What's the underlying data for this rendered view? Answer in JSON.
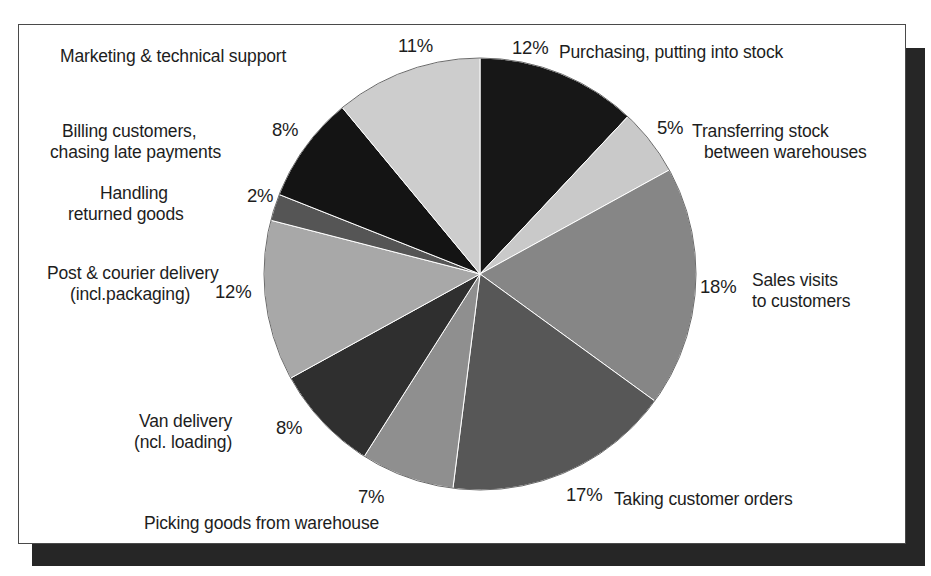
{
  "figure": {
    "background_color": "#ffffff",
    "frame_border_color": "#4a4a4a",
    "shadow_color": "#262626"
  },
  "chart_data": {
    "type": "pie",
    "title": "",
    "subtitle": "",
    "xlabel": "",
    "ylabel": "",
    "grid": false,
    "legend_position": "callout-labels-around-pie",
    "total": 100,
    "units": "percent",
    "start_angle_deg": 0,
    "direction": "clockwise",
    "categories": [
      "Purchasing, putting into stock",
      "Transferring stock between warehouses",
      "Sales visits to customers",
      "Taking customer orders",
      "Picking goods from warehouse",
      "Van delivery (incl. loading)",
      "Post & courier delivery (incl. packaging)",
      "Handling returned goods",
      "Billing customers, chasing late payments",
      "Marketing & technical support"
    ],
    "values": [
      12,
      5,
      18,
      17,
      7,
      8,
      12,
      2,
      8,
      11
    ],
    "slice_colors": [
      "#171717",
      "#c9c9c9",
      "#868686",
      "#575757",
      "#8f8f8f",
      "#2f2f2f",
      "#a8a8a8",
      "#555555",
      "#141414",
      "#cdcdcd"
    ],
    "slices": [
      {
        "label": "Purchasing, putting into stock",
        "value": 12,
        "pct_text": "12%",
        "color": "#171717"
      },
      {
        "label": "Transferring stock between warehouses",
        "value": 5,
        "pct_text": "5%",
        "color": "#c9c9c9"
      },
      {
        "label": "Sales visits to customers",
        "value": 18,
        "pct_text": "18%",
        "color": "#868686"
      },
      {
        "label": "Taking customer orders",
        "value": 17,
        "pct_text": "17%",
        "color": "#575757"
      },
      {
        "label": "Picking goods from warehouse",
        "value": 7,
        "pct_text": "7%",
        "color": "#8f8f8f"
      },
      {
        "label": "Van delivery (incl. loading)",
        "value": 8,
        "pct_text": "8%",
        "color": "#2f2f2f"
      },
      {
        "label": "Post & courier delivery (incl. packaging)",
        "value": 12,
        "pct_text": "12%",
        "color": "#a8a8a8"
      },
      {
        "label": "Handling returned goods",
        "value": 2,
        "pct_text": "2%",
        "color": "#555555"
      },
      {
        "label": "Billing customers, chasing late payments",
        "value": 8,
        "pct_text": "8%",
        "color": "#141414"
      },
      {
        "label": "Marketing & technical support",
        "value": 11,
        "pct_text": "11%",
        "color": "#cdcdcd"
      }
    ]
  },
  "labels": {
    "marketing_support": "Marketing & technical support",
    "marketing_support_pct": "11%",
    "purchasing_pct": "12%",
    "purchasing": "Purchasing, putting into stock",
    "billing_line1": "Billing customers,",
    "billing_line2": "chasing late payments",
    "billing_pct": "8%",
    "transferring_pct": "5%",
    "transferring_line1": "Transferring stock",
    "transferring_line2": "between warehouses",
    "handling_line1": "Handling",
    "handling_line2": "returned goods",
    "handling_pct": "2%",
    "post_line1": "Post & courier delivery",
    "post_line2": "(incl.packaging)",
    "post_pct": "12%",
    "sales_pct": "18%",
    "sales_line1": "Sales visits",
    "sales_line2": "to customers",
    "van_line1": "Van delivery",
    "van_line2": "(ncl. loading)",
    "van_pct": "8%",
    "picking_pct": "7%",
    "picking": "Picking goods from warehouse",
    "taking_pct": "17%",
    "taking": "Taking customer orders"
  }
}
